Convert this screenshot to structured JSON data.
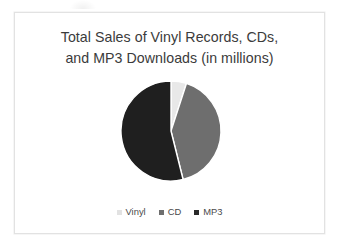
{
  "slide": {
    "title_line_1": "Total Sales of Vinyl Records, CDs,",
    "title_line_2": "and MP3 Downloads (in millions)",
    "background_color": "#ffffff",
    "border_color": "#e2e2e2"
  },
  "chart_data": {
    "type": "pie",
    "title": "Total Sales of Vinyl Records, CDs, and MP3 Downloads (in millions)",
    "xlabel": "",
    "ylabel": "",
    "legend_position": "bottom",
    "grid": false,
    "start_angle_deg": 0,
    "direction": "clockwise",
    "categories": [
      "Vinyl",
      "CD",
      "MP3"
    ],
    "values": [
      5,
      41,
      54
    ],
    "unit": "percent",
    "colors": [
      "#e8e8e8",
      "#6e6e6e",
      "#1f1f1f"
    ],
    "slices": [
      {
        "label": "Vinyl",
        "value": 5,
        "color": "#e8e8e8",
        "start_deg": 0,
        "end_deg": 18
      },
      {
        "label": "CD",
        "value": 41,
        "color": "#6e6e6e",
        "start_deg": 18,
        "end_deg": 166
      },
      {
        "label": "MP3",
        "value": 54,
        "color": "#1f1f1f",
        "start_deg": 166,
        "end_deg": 360
      }
    ]
  },
  "legend": {
    "items": [
      {
        "label": "Vinyl",
        "color": "#e2e2e2"
      },
      {
        "label": "CD",
        "color": "#6e6e6e"
      },
      {
        "label": "MP3",
        "color": "#2a2a2a"
      }
    ]
  }
}
